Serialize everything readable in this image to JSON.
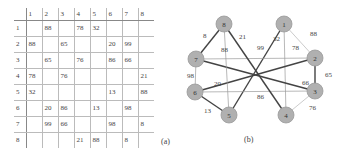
{
  "matrix": {
    "col_headers": [
      "",
      "1",
      "2",
      "3",
      "4",
      "5",
      "6",
      "7",
      "8"
    ],
    "rows": [
      {
        "label": "1",
        "cells": [
          "",
          "88",
          "",
          "78",
          "32",
          "",
          "",
          ""
        ]
      },
      {
        "label": "2",
        "cells": [
          "88",
          "",
          "65",
          "",
          "",
          "20",
          "99",
          ""
        ]
      },
      {
        "label": "3",
        "cells": [
          "",
          "65",
          "",
          "76",
          "",
          "86",
          "66",
          ""
        ]
      },
      {
        "label": "4",
        "cells": [
          "78",
          "",
          "76",
          "",
          "",
          "",
          "",
          "21"
        ]
      },
      {
        "label": "5",
        "cells": [
          "32",
          "",
          "",
          "",
          "",
          "13",
          "",
          "88"
        ]
      },
      {
        "label": "6",
        "cells": [
          "",
          "20",
          "86",
          "",
          "13",
          "",
          "98",
          ""
        ]
      },
      {
        "label": "7",
        "cells": [
          "",
          "99",
          "66",
          "",
          "",
          "98",
          "",
          "8"
        ]
      },
      {
        "label": "8",
        "cells": [
          "",
          "",
          "",
          "21",
          "88",
          "",
          "8",
          ""
        ]
      }
    ],
    "caption": "(a)"
  },
  "graph": {
    "caption": "(b)",
    "node_color": "#b0b0b0",
    "nodes": [
      {
        "id": "1",
        "x": 114,
        "y": 24
      },
      {
        "id": "2",
        "x": 145,
        "y": 58
      },
      {
        "id": "3",
        "x": 145,
        "y": 91
      },
      {
        "id": "4",
        "x": 116,
        "y": 115
      },
      {
        "id": "5",
        "x": 59,
        "y": 115
      },
      {
        "id": "6",
        "x": 25,
        "y": 92
      },
      {
        "id": "7",
        "x": 26,
        "y": 59
      },
      {
        "id": "8",
        "x": 54,
        "y": 24
      }
    ],
    "edges": [
      {
        "from": "1",
        "to": "2",
        "weight": "88",
        "style": "light",
        "lx": 140,
        "ly": 36
      },
      {
        "from": "1",
        "to": "4",
        "weight": "78",
        "style": "thin",
        "lx": 122,
        "ly": 50
      },
      {
        "from": "1",
        "to": "5",
        "weight": "32",
        "style": "thick",
        "lx": 103,
        "ly": 41
      },
      {
        "from": "2",
        "to": "3",
        "weight": "65",
        "style": "thick",
        "lx": 155,
        "ly": 77
      },
      {
        "from": "2",
        "to": "6",
        "weight": "20",
        "style": "thick",
        "lx": 44,
        "ly": 86
      },
      {
        "from": "2",
        "to": "7",
        "weight": "99",
        "style": "thin",
        "lx": 87,
        "ly": 50
      },
      {
        "from": "3",
        "to": "4",
        "weight": "76",
        "style": "light",
        "lx": 139,
        "ly": 110
      },
      {
        "from": "3",
        "to": "6",
        "weight": "86",
        "style": "thin",
        "lx": 87,
        "ly": 99
      },
      {
        "from": "3",
        "to": "7",
        "weight": "66",
        "style": "thick",
        "lx": 132,
        "ly": 85
      },
      {
        "from": "4",
        "to": "8",
        "weight": "21",
        "style": "thick",
        "lx": 69,
        "ly": 39
      },
      {
        "from": "5",
        "to": "6",
        "weight": "13",
        "style": "thick",
        "lx": 34,
        "ly": 113
      },
      {
        "from": "5",
        "to": "8",
        "weight": "88",
        "style": "thin",
        "lx": 51,
        "ly": 52
      },
      {
        "from": "6",
        "to": "7",
        "weight": "98",
        "style": "thin",
        "lx": 17,
        "ly": 78
      },
      {
        "from": "7",
        "to": "8",
        "weight": "8",
        "style": "thick",
        "lx": 33,
        "ly": 38
      }
    ]
  }
}
